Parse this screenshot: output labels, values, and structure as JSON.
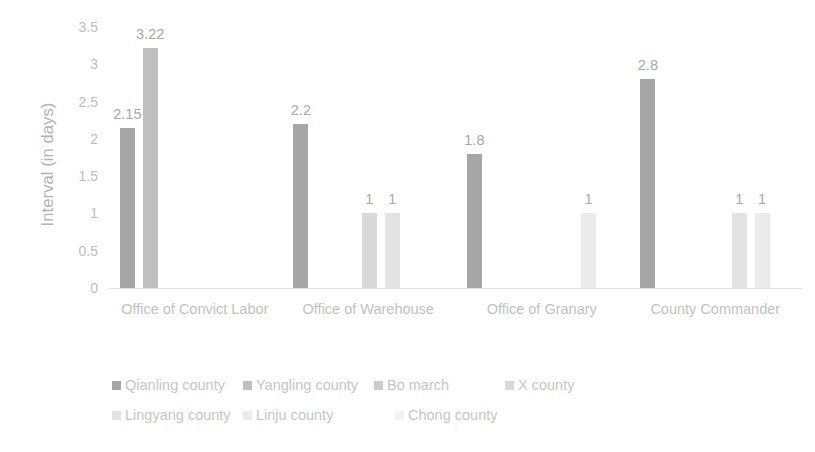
{
  "chart_data": {
    "type": "bar",
    "title": "",
    "subtitle": "",
    "xlabel": "",
    "ylabel": "Interval (in days)",
    "ylim": [
      0,
      3.5
    ],
    "ytick_labels": [
      "0",
      "0.5",
      "1",
      "1.5",
      "2",
      "2.5",
      "3",
      "3.5"
    ],
    "ytick_values": [
      0,
      0.5,
      1,
      1.5,
      2,
      2.5,
      3,
      3.5
    ],
    "grid": false,
    "legend_position": "bottom",
    "categories": [
      "Office of Convict Labor",
      "Office of Warehouse",
      "Office of Granary",
      "County Commander"
    ],
    "series": [
      {
        "name": "Qianling county",
        "color": "#a6a6a6",
        "values": [
          2.15,
          2.2,
          1.8,
          2.8
        ]
      },
      {
        "name": "Yangling county",
        "color": "#bfbfbf",
        "values": [
          3.22,
          null,
          null,
          null
        ]
      },
      {
        "name": "Bo march",
        "color": "#cccccc",
        "values": [
          null,
          null,
          null,
          null
        ]
      },
      {
        "name": "X county",
        "color": "#d9d9d9",
        "values": [
          null,
          1,
          null,
          null
        ]
      },
      {
        "name": "Lingyang county",
        "color": "#e3e3e3",
        "values": [
          null,
          1,
          null,
          1
        ]
      },
      {
        "name": "Linju county",
        "color": "#ebebeb",
        "values": [
          null,
          null,
          1,
          1
        ]
      },
      {
        "name": "Chong county",
        "color": "#f2f2f2",
        "values": [
          null,
          null,
          null,
          null
        ]
      }
    ],
    "data_labels": [
      [
        "2.15",
        "3.22"
      ],
      [
        "2.2",
        "1",
        "1"
      ],
      [
        "1.8",
        "1"
      ],
      [
        "2.8",
        "1",
        "1"
      ]
    ]
  },
  "legend": {
    "rows": [
      [
        "Qianling county",
        "Yangling county",
        "Bo march",
        "X county"
      ],
      [
        "Lingyang county",
        "Linju county",
        "Chong county"
      ]
    ]
  }
}
